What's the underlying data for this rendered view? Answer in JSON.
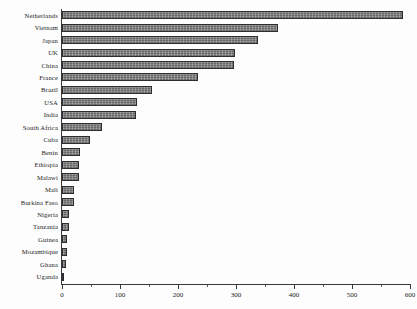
{
  "chart_data": {
    "type": "bar",
    "orientation": "horizontal",
    "title": "",
    "xlabel": "",
    "ylabel": "",
    "xlim": [
      0,
      600
    ],
    "xticks": [
      0,
      100,
      200,
      300,
      400,
      500,
      600
    ],
    "xtick_labels": [
      "0",
      "100",
      "200",
      "300",
      "400",
      "500",
      "600"
    ],
    "minor_xticks": [
      50,
      150,
      250,
      350,
      450,
      550
    ],
    "grid": false,
    "legend": null,
    "bar_color": "#787878",
    "bar_edge_color": "#2e2e2e",
    "categories": [
      "Netherlands",
      "Vietnam",
      "Japan",
      "UK",
      "China",
      "France",
      "Brazil",
      "USA",
      "India",
      "South Africa",
      "Cuba",
      "Benin",
      "Ethiopia",
      "Malawi",
      "Mali",
      "Burkina Faso",
      "Nigeria",
      "Tanzania",
      "Guinea",
      "Mozambique",
      "Ghana",
      "Uganda"
    ],
    "values": [
      588,
      373,
      338,
      298,
      297,
      235,
      155,
      129,
      128,
      69,
      48,
      31,
      30,
      30,
      20,
      20,
      12,
      12,
      8,
      8,
      7,
      3
    ]
  }
}
